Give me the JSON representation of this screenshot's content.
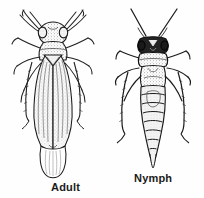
{
  "figure": {
    "style": "black-and-white stippled line drawing",
    "background_color": "#fefefe",
    "ink_color": "#1b1b1b",
    "shade_color": "#b9b9b9",
    "specimens": [
      {
        "id": "adult",
        "label": "Adult",
        "icon_name": "adult-insect-icon",
        "features": "winged adult, long folded wings covering abdomen, short antennae, six legs"
      },
      {
        "id": "nymph",
        "label": "Nymph",
        "icon_name": "nymph-insect-icon",
        "features": "wingless nymph, long antennae, segmented tapering abdomen, six spiny legs"
      }
    ]
  }
}
